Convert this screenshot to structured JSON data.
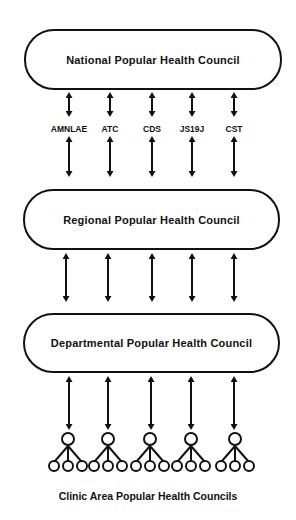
{
  "diagram": {
    "levels": [
      {
        "id": "national",
        "label": "National Popular Health Council"
      },
      {
        "id": "regional",
        "label": "Regional Popular Health Council"
      },
      {
        "id": "departmental",
        "label": "Departmental Popular Health Council"
      }
    ],
    "organizations": [
      {
        "label": "AMNLAE"
      },
      {
        "label": "ATC"
      },
      {
        "label": "CDS"
      },
      {
        "label": "JS19J"
      },
      {
        "label": "CST"
      }
    ],
    "clinic_caption": "Clinic Area Popular Health Councils",
    "clinic_group_count": 5,
    "connector_type": "double-headed-arrow",
    "colors": {
      "line": "#111111",
      "background": "#ffffff"
    }
  }
}
